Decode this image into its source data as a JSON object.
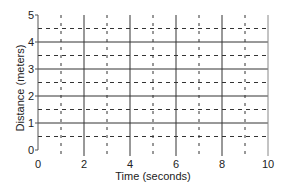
{
  "chart_data": {
    "type": "line",
    "title": "",
    "xlabel": "Time (seconds)",
    "ylabel": "Distance (meters)",
    "xlim": [
      0,
      10
    ],
    "ylim": [
      0,
      5
    ],
    "x_ticks": [
      0,
      2,
      4,
      6,
      8,
      10
    ],
    "x_tick_labels": [
      "0",
      "2",
      "4",
      "6",
      "8",
      "10"
    ],
    "y_ticks": [
      0,
      1,
      2,
      3,
      4,
      5
    ],
    "y_tick_labels": [
      "0",
      "1",
      "2",
      "3",
      "4",
      "5"
    ],
    "grid": {
      "major_x": [
        2,
        4,
        6,
        8,
        10
      ],
      "minor_x_dashed": [
        1,
        3,
        5,
        7,
        9
      ],
      "major_y": [
        1,
        2,
        3,
        4
      ],
      "minor_y_dashed": [
        0.5,
        1.5,
        2.5,
        3.5,
        4.5
      ]
    },
    "series": [],
    "legend": null,
    "colors": {
      "grid": "#333333",
      "axis": "#555555"
    }
  }
}
